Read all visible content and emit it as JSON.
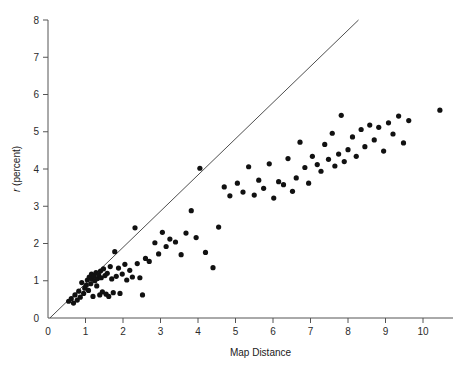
{
  "chart_data": {
    "type": "scatter",
    "title": "",
    "xlabel": "Map Distance",
    "ylabel_prefix": "r",
    "ylabel_suffix": " (percent)",
    "ylabel": "r (percent)",
    "xlim": [
      0,
      10.8
    ],
    "ylim": [
      0,
      8
    ],
    "xticks": [
      0,
      1,
      2,
      3,
      4,
      5,
      6,
      7,
      8,
      9,
      10
    ],
    "yticks": [
      0,
      1,
      2,
      3,
      4,
      5,
      6,
      7,
      8
    ],
    "xtick_labels": [
      "0",
      "1",
      "2",
      "3",
      "4",
      "5",
      "6",
      "7",
      "8",
      "9",
      "10"
    ],
    "ytick_labels": [
      "0",
      "1",
      "2",
      "3",
      "4",
      "5",
      "6",
      "7",
      "8"
    ],
    "grid": false,
    "legend": false,
    "marker_color": "#111111",
    "marker_size": 2.6,
    "reference_line": {
      "label": "identity-line",
      "x0": 0.05,
      "y0": 0.0,
      "x1": 8.28,
      "y1": 8.0,
      "color": "#3a3a3a"
    },
    "points": [
      [
        0.55,
        0.45
      ],
      [
        0.62,
        0.52
      ],
      [
        0.68,
        0.4
      ],
      [
        0.72,
        0.62
      ],
      [
        0.78,
        0.48
      ],
      [
        0.82,
        0.72
      ],
      [
        0.86,
        0.56
      ],
      [
        0.9,
        0.95
      ],
      [
        0.95,
        0.66
      ],
      [
        0.98,
        0.8
      ],
      [
        1.02,
        0.88
      ],
      [
        1.05,
        1.02
      ],
      [
        1.08,
        0.74
      ],
      [
        1.1,
        1.1
      ],
      [
        1.14,
        0.92
      ],
      [
        1.16,
        1.18
      ],
      [
        1.18,
        1.04
      ],
      [
        1.2,
        0.58
      ],
      [
        1.22,
        1.12
      ],
      [
        1.25,
        1.0
      ],
      [
        1.28,
        1.22
      ],
      [
        1.3,
        0.86
      ],
      [
        1.32,
        1.06
      ],
      [
        1.35,
        1.16
      ],
      [
        1.38,
        0.62
      ],
      [
        1.4,
        1.26
      ],
      [
        1.42,
        1.08
      ],
      [
        1.45,
        0.7
      ],
      [
        1.48,
        1.32
      ],
      [
        1.52,
        1.14
      ],
      [
        1.55,
        0.64
      ],
      [
        1.58,
        1.2
      ],
      [
        1.62,
        0.58
      ],
      [
        1.66,
        1.38
      ],
      [
        1.7,
        1.05
      ],
      [
        1.74,
        0.68
      ],
      [
        1.78,
        1.78
      ],
      [
        1.82,
        1.12
      ],
      [
        1.88,
        1.34
      ],
      [
        1.92,
        0.66
      ],
      [
        1.98,
        1.18
      ],
      [
        2.05,
        1.44
      ],
      [
        2.1,
        1.02
      ],
      [
        2.18,
        1.28
      ],
      [
        2.25,
        1.1
      ],
      [
        2.32,
        2.42
      ],
      [
        2.38,
        1.46
      ],
      [
        2.45,
        1.08
      ],
      [
        2.52,
        0.62
      ],
      [
        2.6,
        1.6
      ],
      [
        2.7,
        1.52
      ],
      [
        2.85,
        2.02
      ],
      [
        2.95,
        1.72
      ],
      [
        3.05,
        2.3
      ],
      [
        3.15,
        1.92
      ],
      [
        3.25,
        2.12
      ],
      [
        3.4,
        2.04
      ],
      [
        3.55,
        1.7
      ],
      [
        3.68,
        2.28
      ],
      [
        3.82,
        2.88
      ],
      [
        3.95,
        2.16
      ],
      [
        4.05,
        4.02
      ],
      [
        4.2,
        1.76
      ],
      [
        4.4,
        1.35
      ],
      [
        4.55,
        2.44
      ],
      [
        4.7,
        3.52
      ],
      [
        4.85,
        3.28
      ],
      [
        5.05,
        3.62
      ],
      [
        5.2,
        3.38
      ],
      [
        5.35,
        4.06
      ],
      [
        5.5,
        3.3
      ],
      [
        5.62,
        3.7
      ],
      [
        5.75,
        3.48
      ],
      [
        5.9,
        4.14
      ],
      [
        6.02,
        3.22
      ],
      [
        6.15,
        3.66
      ],
      [
        6.28,
        3.58
      ],
      [
        6.4,
        4.28
      ],
      [
        6.52,
        3.4
      ],
      [
        6.62,
        3.76
      ],
      [
        6.72,
        4.72
      ],
      [
        6.85,
        4.04
      ],
      [
        6.95,
        3.62
      ],
      [
        7.05,
        4.34
      ],
      [
        7.18,
        4.12
      ],
      [
        7.28,
        3.94
      ],
      [
        7.38,
        4.66
      ],
      [
        7.48,
        4.26
      ],
      [
        7.58,
        4.96
      ],
      [
        7.65,
        4.08
      ],
      [
        7.75,
        4.4
      ],
      [
        7.82,
        5.44
      ],
      [
        7.9,
        4.2
      ],
      [
        8.0,
        4.52
      ],
      [
        8.12,
        4.86
      ],
      [
        8.22,
        4.34
      ],
      [
        8.35,
        5.06
      ],
      [
        8.45,
        4.6
      ],
      [
        8.58,
        5.18
      ],
      [
        8.7,
        4.78
      ],
      [
        8.82,
        5.12
      ],
      [
        8.95,
        4.48
      ],
      [
        9.08,
        5.24
      ],
      [
        9.2,
        4.94
      ],
      [
        9.35,
        5.42
      ],
      [
        9.48,
        4.7
      ],
      [
        9.62,
        5.3
      ],
      [
        10.45,
        5.58
      ]
    ]
  }
}
